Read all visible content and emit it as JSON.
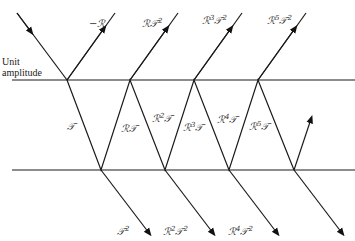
{
  "figure": {
    "side_label_line1": "Unit",
    "side_label_line2": "amplitude",
    "top_reflected_labels": [
      {
        "base": "−ℛ",
        "sup": ""
      },
      {
        "base": "ℛ𝒯",
        "sup": "2"
      },
      {
        "base": "ℛ",
        "sup": "3",
        "base2": "𝒯",
        "sup2": "2"
      },
      {
        "base": "ℛ",
        "sup": "5",
        "base2": "𝒯",
        "sup2": "2"
      }
    ],
    "inner_labels": [
      {
        "base": "𝒯",
        "sup": ""
      },
      {
        "base": "ℛ𝒯",
        "sup": ""
      },
      {
        "base": "ℛ",
        "sup": "2",
        "base2": "𝒯"
      },
      {
        "base": "ℛ",
        "sup": "3",
        "base2": "𝒯"
      },
      {
        "base": "ℛ",
        "sup": "4",
        "base2": "𝒯"
      },
      {
        "base": "ℛ",
        "sup": "5",
        "base2": "𝒯"
      }
    ],
    "bottom_transmitted_labels": [
      {
        "base": "𝒯",
        "sup": "2"
      },
      {
        "base": "ℛ",
        "sup": "2",
        "base2": "𝒯",
        "sup2": "2"
      },
      {
        "base": "ℛ",
        "sup": "4",
        "base2": "𝒯",
        "sup2": "2"
      }
    ]
  }
}
